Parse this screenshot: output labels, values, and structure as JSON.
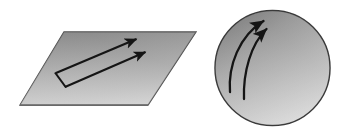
{
  "figure": {
    "title": "Parallel transport of vectors on a flat plane versus a curved surface",
    "background_color": "#ffffff",
    "width": 345,
    "height": 137,
    "stroke_color": "#1a1a1a",
    "outline_color": "#3a3a3a",
    "panels": [
      {
        "id": "flat-plane-panel",
        "label": "flat plane with two parallel vectors",
        "shape": "parallelogram",
        "vertices": [
          [
            64,
            32
          ],
          [
            196,
            32
          ],
          [
            148,
            105
          ],
          [
            20,
            105
          ]
        ],
        "fill_gradient": {
          "from": "#6f6f6f",
          "mid": "#a8a8a8",
          "to": "#e6e6e6",
          "angle_deg": 115
        },
        "outline_color": "#4a4a4a",
        "vectors": [
          {
            "id": "upper-vector",
            "tail": [
              56,
              73
            ],
            "tip": [
              139,
              38
            ],
            "arrowhead": "solid-triangle"
          },
          {
            "id": "lower-vector",
            "tail": [
              65,
              87
            ],
            "tip": [
              148,
              51
            ],
            "arrowhead": "solid-triangle"
          }
        ],
        "connector": {
          "id": "perpendicular-tick",
          "from": [
            56,
            73
          ],
          "to": [
            65,
            87
          ],
          "note": "short segment joining the two vector tails"
        }
      },
      {
        "id": "curved-sphere-panel",
        "label": "sphere with two curved converging vectors",
        "shape": "circle",
        "center": [
          272,
          68
        ],
        "radius": 58,
        "fill_gradient": {
          "from": "#717171",
          "mid": "#a5a5a5",
          "to": "#ededed",
          "angle_deg": 120
        },
        "outline_color": "#3a3a3a",
        "vectors": [
          {
            "id": "outer-curved-vector",
            "tail": [
              230,
              92
            ],
            "control": [
              232,
              44
            ],
            "tip": [
              266,
              19
            ],
            "arrowhead": "solid-triangle",
            "curved": true
          },
          {
            "id": "inner-curved-vector",
            "tail": [
              244,
              99
            ],
            "control": [
              247,
              52
            ],
            "tip": [
              269,
              27
            ],
            "arrowhead": "solid-triangle",
            "curved": true
          }
        ]
      }
    ]
  }
}
